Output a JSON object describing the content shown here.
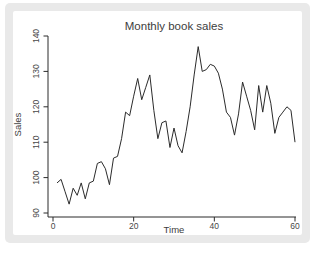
{
  "figure": {
    "colors": {
      "frame_bg": "#e9e9e9",
      "plot_bg": "#ffffff",
      "line": "#2b2b2b",
      "axis": "#2b2b2b",
      "text": "#3d3d3d"
    }
  },
  "chart_data": {
    "type": "line",
    "title": "Monthly book sales",
    "xlabel": "Time",
    "ylabel": "Sales",
    "x_ticks": [
      0,
      20,
      40,
      60
    ],
    "y_ticks": [
      90,
      100,
      110,
      120,
      130,
      140
    ],
    "xlim": [
      0,
      61
    ],
    "ylim": [
      88,
      141
    ],
    "grid": false,
    "legend": "none",
    "x_start": 1,
    "x_step": 1,
    "values": [
      98.5,
      99.5,
      96,
      92.5,
      97,
      95,
      98.5,
      94,
      98.5,
      99,
      104,
      104.5,
      102.5,
      98,
      105.5,
      106,
      111,
      118.5,
      117.5,
      123,
      128,
      122,
      125.5,
      129,
      119,
      111,
      115.5,
      116,
      108.5,
      114,
      109,
      107,
      113,
      120,
      129,
      137,
      130,
      130.5,
      132,
      131.5,
      129.5,
      125,
      118.5,
      117,
      112,
      118,
      127,
      123,
      119,
      113.5,
      126,
      118.5,
      126,
      121,
      112.5,
      117,
      118.5,
      120,
      119,
      110
    ]
  }
}
